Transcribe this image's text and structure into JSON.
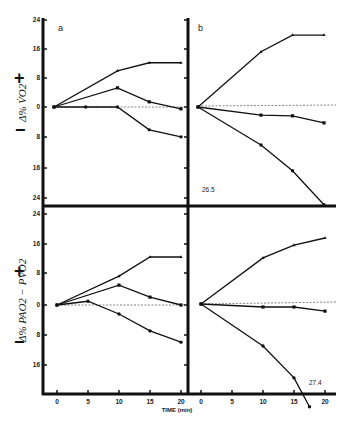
{
  "figure": {
    "panel_labels": [
      "a",
      "b"
    ],
    "top_ylabel": "Δ% V̇O2",
    "bottom_ylabel": "Δ% PAO2 − PVO2",
    "plus_sign": "+",
    "minus_sign": "−",
    "xlabel": "TIME (min)",
    "x_ticks": [
      "0",
      "5",
      "10",
      "15",
      "20"
    ],
    "y_ticks_top": [
      "24",
      "16",
      "8",
      "0",
      "8",
      "16",
      "24"
    ],
    "y_ticks_bottom": [
      "24",
      "16",
      "8",
      "0",
      "8",
      "16"
    ],
    "annotation_top_b": "26.5",
    "annotation_bottom_b": "27.4"
  },
  "chart_data": [
    {
      "type": "line",
      "panel": "top-a",
      "title": "a",
      "xlabel": "TIME (min)",
      "ylabel": "Δ% V̇O2",
      "x": [
        0,
        5,
        10,
        15,
        20
      ],
      "ylim": [
        -24,
        24
      ],
      "series": [
        {
          "name": "triangle",
          "marker": "triangle",
          "x": [
            0,
            10,
            15,
            20
          ],
          "values": [
            0,
            9.8,
            12,
            12
          ]
        },
        {
          "name": "square",
          "marker": "square",
          "x": [
            0,
            10,
            15,
            20
          ],
          "values": [
            0,
            5.2,
            1.4,
            -0.5
          ]
        },
        {
          "name": "circle",
          "marker": "circle",
          "x": [
            0,
            5,
            10,
            15,
            20
          ],
          "values": [
            0,
            0,
            0,
            -6.2,
            -8.1
          ]
        }
      ],
      "reference_line": {
        "y": 0,
        "style": "dashed"
      }
    },
    {
      "type": "line",
      "panel": "top-b",
      "title": "b",
      "xlabel": "TIME (min)",
      "ylabel": "Δ% V̇O2",
      "x": [
        0,
        5,
        10,
        15,
        20
      ],
      "ylim": [
        -24,
        24
      ],
      "series": [
        {
          "name": "triangle",
          "marker": "triangle",
          "x": [
            0,
            10,
            15,
            20
          ],
          "values": [
            0,
            15,
            19.5,
            19.5
          ]
        },
        {
          "name": "square",
          "marker": "square",
          "x": [
            0,
            10,
            15,
            20
          ],
          "values": [
            0,
            -2.2,
            -2.4,
            -4.3
          ]
        },
        {
          "name": "circle",
          "marker": "circle",
          "x": [
            0,
            10,
            15,
            20
          ],
          "values": [
            0,
            -10.3,
            -17.3,
            -26.5
          ]
        }
      ],
      "annotations": [
        {
          "text": "26.5",
          "x": 20,
          "y": -26.5
        }
      ],
      "reference_line": {
        "y": 0,
        "style": "dashed"
      }
    },
    {
      "type": "line",
      "panel": "bottom-a",
      "title": "",
      "xlabel": "TIME (min)",
      "ylabel": "Δ% PAO2 − PVO2",
      "x": [
        0,
        5,
        10,
        15,
        20
      ],
      "ylim": [
        -24,
        24
      ],
      "series": [
        {
          "name": "triangle",
          "marker": "triangle",
          "x": [
            0,
            10,
            15,
            20
          ],
          "values": [
            0,
            7.7,
            12.8,
            12.8
          ]
        },
        {
          "name": "square",
          "marker": "square",
          "x": [
            0,
            10,
            15,
            20
          ],
          "values": [
            0,
            5.3,
            2.1,
            0
          ]
        },
        {
          "name": "circle",
          "marker": "circle",
          "x": [
            0,
            5,
            10,
            15,
            20
          ],
          "values": [
            0,
            1,
            -2.4,
            -6.9,
            -9.9
          ]
        }
      ],
      "reference_line": {
        "y": 0,
        "style": "dashed"
      }
    },
    {
      "type": "line",
      "panel": "bottom-b",
      "title": "",
      "xlabel": "TIME (min)",
      "ylabel": "Δ% PAO2 − PVO2",
      "x": [
        0,
        5,
        10,
        15,
        20
      ],
      "ylim": [
        -24,
        24
      ],
      "series": [
        {
          "name": "triangle",
          "marker": "triangle",
          "x": [
            0,
            10,
            15,
            20
          ],
          "values": [
            0,
            12.3,
            15.7,
            17.6
          ]
        },
        {
          "name": "square",
          "marker": "square",
          "x": [
            0,
            10,
            15,
            20
          ],
          "values": [
            0,
            -0.8,
            -0.8,
            -1.9
          ]
        },
        {
          "name": "circle",
          "marker": "circle",
          "x": [
            0,
            10,
            15,
            17.5
          ],
          "values": [
            0,
            -11.2,
            -19.7,
            -27.4
          ]
        }
      ],
      "annotations": [
        {
          "text": "27.4",
          "x": 17.5,
          "y": -27.4
        }
      ],
      "reference_line": {
        "y": 0,
        "style": "dashed"
      }
    }
  ]
}
